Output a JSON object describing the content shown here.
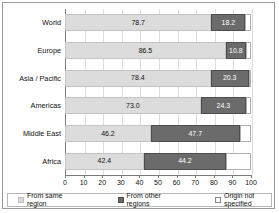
{
  "chart_data": {
    "type": "bar",
    "orientation": "horizontal",
    "stacked": true,
    "title": "",
    "xlabel": "",
    "ylabel": "",
    "xlim": [
      0,
      100
    ],
    "xticks": [
      0,
      10,
      20,
      30,
      40,
      50,
      60,
      70,
      80,
      90,
      100
    ],
    "grid": true,
    "legend_position": "bottom",
    "categories": [
      "World",
      "Europe",
      "Asia / Pacific",
      "Americas",
      "Middle East",
      "Africa"
    ],
    "series": [
      {
        "name": "From same region",
        "color": "#dcdcdc",
        "values": [
          78.7,
          86.5,
          78.4,
          73.0,
          46.2,
          42.4
        ],
        "labels": [
          "78.7",
          "86.5",
          "78.4",
          "73.0",
          "46.2",
          "42.4"
        ]
      },
      {
        "name": "From other regions",
        "color": "#6b6b6b",
        "values": [
          18.2,
          10.8,
          20.3,
          24.3,
          47.7,
          44.2
        ],
        "labels": [
          "18.2",
          "10.8",
          "20.3",
          "24.3",
          "47.7",
          "44.2"
        ]
      },
      {
        "name": "Origin not specified",
        "color": "#ffffff",
        "values": [
          3.1,
          2.7,
          1.3,
          2.7,
          6.1,
          13.4
        ],
        "labels": [
          "",
          "",
          "",
          "",
          "",
          ""
        ]
      }
    ]
  },
  "legend": {
    "items": [
      {
        "label": "From same region"
      },
      {
        "label": "From other regions"
      },
      {
        "label": "Origin not specified"
      }
    ]
  }
}
